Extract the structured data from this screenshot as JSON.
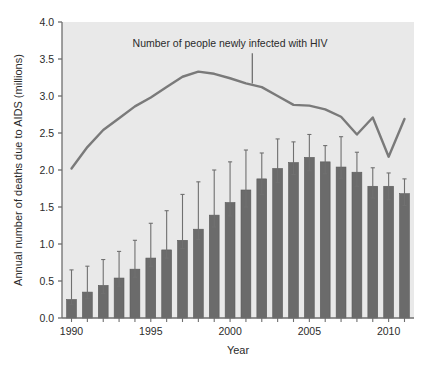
{
  "chart_data": {
    "type": "bar",
    "title": "",
    "xlabel": "Year",
    "ylabel": "Annual number of deaths due to AIDS (millions)",
    "xlim": [
      1989.4,
      2011.6
    ],
    "ylim": [
      0.0,
      4.0
    ],
    "grid": false,
    "legend_position": "none",
    "categories": [
      1990,
      1991,
      1992,
      1993,
      1994,
      1995,
      1996,
      1997,
      1998,
      1999,
      2000,
      2001,
      2002,
      2003,
      2004,
      2005,
      2006,
      2007,
      2008,
      2009,
      2010,
      2011
    ],
    "x_tick_labels": [
      "1990",
      "1995",
      "2000",
      "2005",
      "2010"
    ],
    "x_tick_values": [
      1990,
      1995,
      2000,
      2005,
      2010
    ],
    "y_tick_labels": [
      "0.0",
      "0.5",
      "1.0",
      "1.5",
      "2.0",
      "2.5",
      "3.0",
      "3.5",
      "4.0"
    ],
    "y_tick_values": [
      0.0,
      0.5,
      1.0,
      1.5,
      2.0,
      2.5,
      3.0,
      3.5,
      4.0
    ],
    "series": [
      {
        "name": "Annual number of deaths due to AIDS (millions)",
        "type": "bar",
        "color": "#6b6b6b",
        "values": [
          0.25,
          0.35,
          0.44,
          0.54,
          0.66,
          0.81,
          0.92,
          1.05,
          1.2,
          1.39,
          1.56,
          1.73,
          1.88,
          2.02,
          2.1,
          2.17,
          2.11,
          2.04,
          1.97,
          1.78,
          1.78,
          1.68
        ],
        "error_low": [
          0.18,
          0.26,
          0.33,
          0.43,
          0.55,
          0.7,
          0.81,
          0.94,
          1.06,
          1.23,
          1.38,
          1.5,
          1.67,
          1.83,
          1.94,
          1.99,
          1.95,
          1.89,
          1.78,
          1.62,
          1.6,
          1.52
        ],
        "error_high": [
          0.65,
          0.7,
          0.79,
          0.9,
          1.05,
          1.28,
          1.45,
          1.67,
          1.84,
          2.0,
          2.11,
          2.27,
          2.23,
          2.42,
          2.38,
          2.48,
          2.33,
          2.45,
          2.24,
          2.03,
          1.96,
          1.88
        ]
      },
      {
        "name": "Number of people newly infected with HIV",
        "type": "line",
        "color": "#7a7a7a",
        "x": [
          1990,
          1991,
          1992,
          1993,
          1994,
          1995,
          1996,
          1997,
          1998,
          1999,
          2000,
          2001,
          2002,
          2003,
          2004,
          2005,
          2006,
          2007,
          2008,
          2009,
          2010,
          2011
        ],
        "values": [
          2.02,
          2.31,
          2.54,
          2.7,
          2.86,
          2.98,
          3.12,
          3.26,
          3.33,
          3.3,
          3.24,
          3.17,
          3.12,
          3.0,
          2.88,
          2.87,
          2.82,
          2.72,
          2.48,
          2.71,
          2.18,
          2.69
        ]
      }
    ],
    "annotations": [
      {
        "text": "Number of people newly infected with HIV",
        "points_to_x": 2001.4,
        "points_to_y": 3.17,
        "label_x": 2000.0,
        "label_y": 3.66
      }
    ]
  },
  "style": {
    "plot_background": "#e9e9e9",
    "axis_color": "#6e6e6e",
    "text_color": "#2b2b2b",
    "bar_color": "#6b6b6b",
    "bar_edge_color": "#5a5a5a",
    "line_color": "#7a7a7a",
    "error_bar_color": "#707070"
  }
}
